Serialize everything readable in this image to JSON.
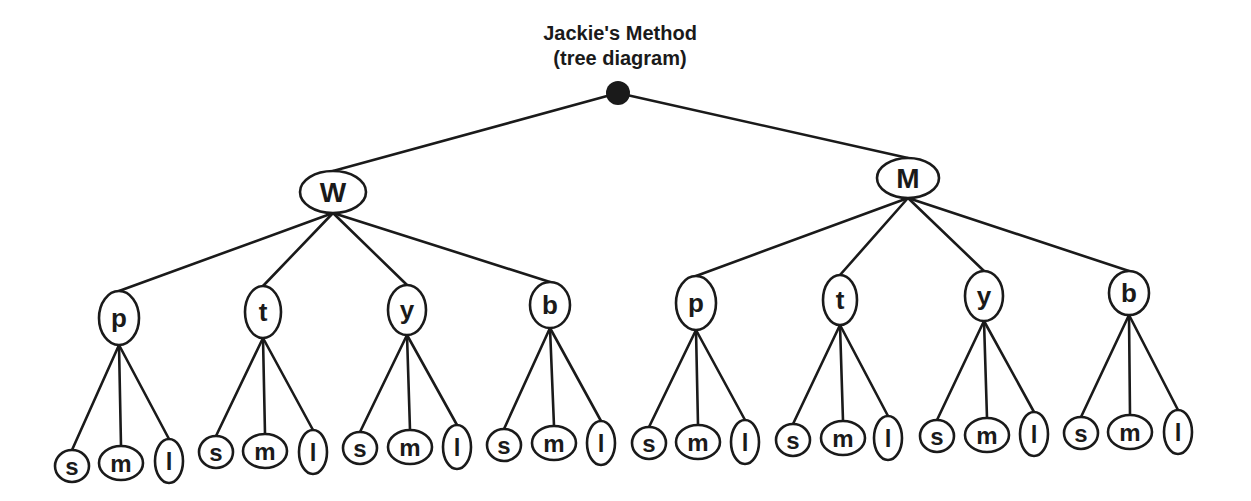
{
  "title": {
    "line1": "Jackie's Method",
    "line2": "(tree diagram)"
  },
  "colors": {
    "ink": "#1a1a1a",
    "background": "#ffffff"
  },
  "root": {
    "label": "",
    "cx": 618,
    "cy": 93,
    "r": 12
  },
  "level1": [
    {
      "label": "W",
      "cx": 333,
      "cy": 192,
      "rx": 33,
      "ry": 21,
      "children": [
        {
          "label": "p",
          "cx": 119,
          "cy": 318,
          "rx": 20,
          "ry": 27,
          "leaves": [
            {
              "label": "s",
              "cx": 72,
              "cy": 466,
              "rx": 17,
              "ry": 16
            },
            {
              "label": "m",
              "cx": 121,
              "cy": 463,
              "rx": 22,
              "ry": 17
            },
            {
              "label": "l",
              "cx": 169,
              "cy": 461,
              "rx": 14,
              "ry": 22
            }
          ]
        },
        {
          "label": "t",
          "cx": 263,
          "cy": 312,
          "rx": 18,
          "ry": 26,
          "leaves": [
            {
              "label": "s",
              "cx": 216,
              "cy": 452,
              "rx": 17,
              "ry": 16
            },
            {
              "label": "m",
              "cx": 265,
              "cy": 451,
              "rx": 22,
              "ry": 17
            },
            {
              "label": "l",
              "cx": 313,
              "cy": 452,
              "rx": 14,
              "ry": 22
            }
          ]
        },
        {
          "label": "y",
          "cx": 407,
          "cy": 310,
          "rx": 19,
          "ry": 25,
          "leaves": [
            {
              "label": "s",
              "cx": 360,
              "cy": 448,
              "rx": 17,
              "ry": 16
            },
            {
              "label": "m",
              "cx": 410,
              "cy": 447,
              "rx": 22,
              "ry": 17
            },
            {
              "label": "l",
              "cx": 457,
              "cy": 447,
              "rx": 14,
              "ry": 22
            }
          ]
        },
        {
          "label": "b",
          "cx": 550,
          "cy": 305,
          "rx": 20,
          "ry": 23,
          "leaves": [
            {
              "label": "s",
              "cx": 504,
              "cy": 445,
              "rx": 17,
              "ry": 16
            },
            {
              "label": "m",
              "cx": 554,
              "cy": 443,
              "rx": 22,
              "ry": 17
            },
            {
              "label": "l",
              "cx": 601,
              "cy": 443,
              "rx": 14,
              "ry": 22
            }
          ]
        }
      ]
    },
    {
      "label": "M",
      "cx": 908,
      "cy": 178,
      "rx": 31,
      "ry": 20,
      "children": [
        {
          "label": "p",
          "cx": 696,
          "cy": 303,
          "rx": 20,
          "ry": 27,
          "leaves": [
            {
              "label": "s",
              "cx": 649,
              "cy": 443,
              "rx": 17,
              "ry": 16
            },
            {
              "label": "m",
              "cx": 698,
              "cy": 442,
              "rx": 22,
              "ry": 17
            },
            {
              "label": "l",
              "cx": 745,
              "cy": 442,
              "rx": 14,
              "ry": 22
            }
          ]
        },
        {
          "label": "t",
          "cx": 840,
          "cy": 300,
          "rx": 17,
          "ry": 25,
          "leaves": [
            {
              "label": "s",
              "cx": 793,
              "cy": 440,
              "rx": 17,
              "ry": 16
            },
            {
              "label": "m",
              "cx": 843,
              "cy": 438,
              "rx": 22,
              "ry": 17
            },
            {
              "label": "l",
              "cx": 888,
              "cy": 438,
              "rx": 14,
              "ry": 22
            }
          ]
        },
        {
          "label": "y",
          "cx": 984,
          "cy": 296,
          "rx": 19,
          "ry": 25,
          "leaves": [
            {
              "label": "s",
              "cx": 937,
              "cy": 436,
              "rx": 17,
              "ry": 16
            },
            {
              "label": "m",
              "cx": 987,
              "cy": 435,
              "rx": 22,
              "ry": 17
            },
            {
              "label": "l",
              "cx": 1034,
              "cy": 434,
              "rx": 14,
              "ry": 22
            }
          ]
        },
        {
          "label": "b",
          "cx": 1129,
          "cy": 293,
          "rx": 20,
          "ry": 22,
          "leaves": [
            {
              "label": "s",
              "cx": 1081,
              "cy": 433,
              "rx": 17,
              "ry": 16
            },
            {
              "label": "m",
              "cx": 1130,
              "cy": 432,
              "rx": 22,
              "ry": 17
            },
            {
              "label": "l",
              "cx": 1178,
              "cy": 432,
              "rx": 14,
              "ry": 22
            }
          ]
        }
      ]
    }
  ]
}
